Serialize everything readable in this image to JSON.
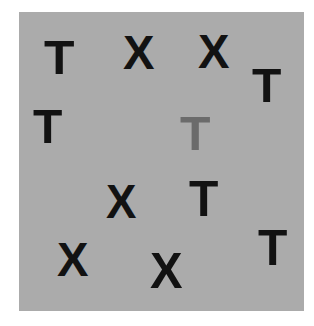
{
  "stimulus": {
    "background_color": "#ababab",
    "page_background": "#ffffff",
    "items": [
      {
        "letter": "T",
        "x": 44,
        "y": 42,
        "w": 28,
        "h": 35,
        "color": "#121212",
        "role": "distractor"
      },
      {
        "letter": "X",
        "x": 123,
        "y": 37,
        "w": 29,
        "h": 35,
        "color": "#121212",
        "role": "distractor"
      },
      {
        "letter": "X",
        "x": 198,
        "y": 36,
        "w": 29,
        "h": 35,
        "color": "#121212",
        "role": "distractor"
      },
      {
        "letter": "T",
        "x": 252,
        "y": 70,
        "w": 27,
        "h": 35,
        "color": "#121212",
        "role": "distractor"
      },
      {
        "letter": "T",
        "x": 33,
        "y": 111,
        "w": 27,
        "h": 35,
        "color": "#121212",
        "role": "distractor"
      },
      {
        "letter": "T",
        "x": 180,
        "y": 118,
        "w": 28,
        "h": 35,
        "color": "#6b6b6b",
        "role": "target"
      },
      {
        "letter": "X",
        "x": 106,
        "y": 186,
        "w": 28,
        "h": 35,
        "color": "#121212",
        "role": "distractor"
      },
      {
        "letter": "T",
        "x": 189,
        "y": 183,
        "w": 27,
        "h": 36,
        "color": "#121212",
        "role": "distractor"
      },
      {
        "letter": "X",
        "x": 57,
        "y": 244,
        "w": 29,
        "h": 35,
        "color": "#121212",
        "role": "distractor"
      },
      {
        "letter": "X",
        "x": 150,
        "y": 255,
        "w": 30,
        "h": 36,
        "color": "#121212",
        "role": "distractor"
      },
      {
        "letter": "T",
        "x": 258,
        "y": 232,
        "w": 27,
        "h": 36,
        "color": "#121212",
        "role": "distractor"
      }
    ]
  }
}
